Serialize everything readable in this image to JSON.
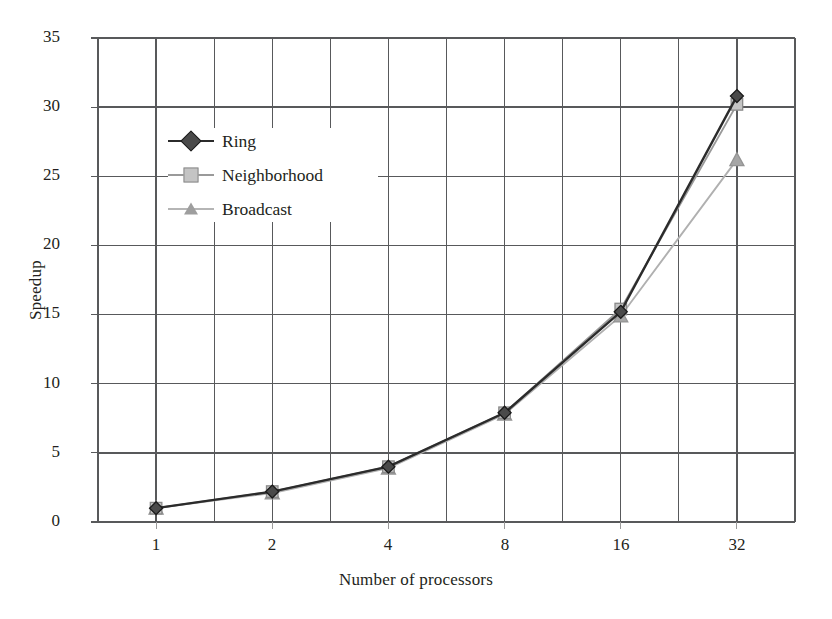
{
  "chart_data": {
    "type": "line",
    "title": "",
    "xlabel": "Number of processors",
    "ylabel": "Speedup",
    "categories": [
      "1",
      "2",
      "4",
      "8",
      "16",
      "32"
    ],
    "x": [
      1,
      2,
      4,
      8,
      16,
      32
    ],
    "xscale": "categorical (log2 spaced labels)",
    "ylim": [
      0,
      35
    ],
    "yticks": [
      0,
      5,
      10,
      15,
      20,
      25,
      30,
      35
    ],
    "xticks": [
      "1",
      "2",
      "4",
      "8",
      "16",
      "32"
    ],
    "grid": true,
    "grid_minor_vertical": true,
    "legend_position": "upper-left-inside",
    "series": [
      {
        "name": "Ring",
        "marker": "diamond",
        "color": "#2b2b2b",
        "line_color": "#2b2b2b",
        "values": [
          1.0,
          2.2,
          4.0,
          7.9,
          15.2,
          30.8
        ]
      },
      {
        "name": "Neighborhood",
        "marker": "square",
        "color": "#b3b3b3",
        "line_color": "#9a9a9a",
        "values": [
          1.0,
          2.2,
          4.0,
          7.9,
          15.4,
          30.2
        ]
      },
      {
        "name": "Broadcast",
        "marker": "triangle",
        "color": "#a6a6a6",
        "line_color": "#b0b0b0",
        "values": [
          1.0,
          2.1,
          3.9,
          7.8,
          14.9,
          26.2
        ]
      }
    ]
  },
  "legend": {
    "items": [
      {
        "label": "Ring",
        "marker": "diamond-marker-icon"
      },
      {
        "label": "Neighborhood",
        "marker": "square-marker-icon"
      },
      {
        "label": "Broadcast",
        "marker": "triangle-marker-icon"
      }
    ]
  },
  "axes": {
    "y_title": "Speedup",
    "x_title": "Number of processors",
    "y_tick_labels": [
      "35",
      "30",
      "25",
      "20",
      "15",
      "10",
      "5",
      "0"
    ],
    "x_tick_labels": [
      "1",
      "2",
      "4",
      "8",
      "16",
      "32"
    ]
  },
  "colors": {
    "ring": "#2b2b2b",
    "neighborhood": "#b3b3b3",
    "broadcast": "#a6a6a6",
    "grid": "#58595b",
    "axis": "#58595b",
    "background": "#ffffff"
  }
}
